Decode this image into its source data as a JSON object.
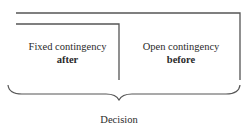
{
  "diagram": {
    "left_box": {
      "line1": "Fixed contingency",
      "line2": "after"
    },
    "right_box": {
      "line1": "Open contingency",
      "line2": "before"
    },
    "brace_label": "Decision"
  },
  "colors": {
    "line": "#555555",
    "text": "#2a2a2a",
    "background": "#ffffff"
  }
}
